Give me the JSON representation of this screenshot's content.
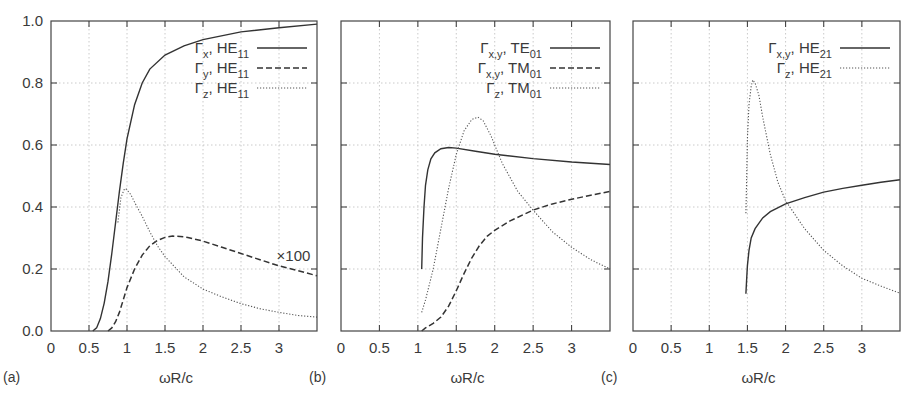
{
  "chart_data": [
    {
      "type": "line",
      "panel_label": "(a)",
      "xlabel": "ωR/c",
      "ylabel": "",
      "xlim": [
        0,
        3.5
      ],
      "ylim": [
        0,
        1.0
      ],
      "xticks": [
        "0",
        "0.5",
        "1",
        "1.5",
        "2",
        "2.5",
        "3"
      ],
      "yticks": [
        "0.0",
        "0.2",
        "0.4",
        "0.6",
        "0.8",
        "1.0"
      ],
      "grid": true,
      "legend_position": "upper right",
      "annotations": [
        {
          "text": "×100",
          "x": 3.1,
          "y": 0.24
        }
      ],
      "series": [
        {
          "name": "Γx, HE11",
          "symbol": "Γ",
          "sub1": "x",
          "mode": "HE",
          "sub2": "11",
          "style": "solid",
          "x": [
            0.55,
            0.6,
            0.65,
            0.7,
            0.75,
            0.8,
            0.85,
            0.9,
            0.95,
            1.0,
            1.1,
            1.2,
            1.3,
            1.5,
            1.75,
            2.0,
            2.5,
            3.0,
            3.5
          ],
          "y": [
            0.0,
            0.01,
            0.04,
            0.09,
            0.16,
            0.25,
            0.35,
            0.45,
            0.54,
            0.62,
            0.73,
            0.8,
            0.845,
            0.89,
            0.92,
            0.94,
            0.965,
            0.978,
            0.99
          ]
        },
        {
          "name": "Γy, HE11",
          "symbol": "Γ",
          "sub1": "y",
          "mode": "HE",
          "sub2": "11",
          "style": "dashed",
          "x": [
            0.75,
            0.8,
            0.85,
            0.9,
            0.95,
            1.0,
            1.1,
            1.2,
            1.3,
            1.4,
            1.5,
            1.6,
            1.7,
            1.8,
            2.0,
            2.25,
            2.5,
            2.75,
            3.0,
            3.25,
            3.5
          ],
          "y": [
            0.0,
            0.01,
            0.03,
            0.06,
            0.1,
            0.14,
            0.2,
            0.245,
            0.275,
            0.292,
            0.302,
            0.306,
            0.305,
            0.302,
            0.29,
            0.27,
            0.25,
            0.23,
            0.21,
            0.195,
            0.178
          ]
        },
        {
          "name": "Γz, HE11",
          "symbol": "Γ",
          "sub1": "z",
          "mode": "HE",
          "sub2": "11",
          "style": "dotted",
          "x": [
            0.88,
            0.92,
            0.96,
            0.98,
            1.0,
            1.05,
            1.1,
            1.2,
            1.3,
            1.4,
            1.5,
            1.75,
            2.0,
            2.25,
            2.5,
            2.75,
            3.0,
            3.25,
            3.5
          ],
          "y": [
            0.35,
            0.43,
            0.455,
            0.46,
            0.455,
            0.44,
            0.415,
            0.37,
            0.32,
            0.275,
            0.24,
            0.175,
            0.135,
            0.11,
            0.088,
            0.072,
            0.06,
            0.05,
            0.045
          ]
        }
      ]
    },
    {
      "type": "line",
      "panel_label": "(b)",
      "xlabel": "ωR/c",
      "ylabel": "",
      "xlim": [
        0,
        3.5
      ],
      "ylim": [
        0,
        1.0
      ],
      "xticks": [
        "0",
        "0.5",
        "1",
        "1.5",
        "2",
        "2.5",
        "3"
      ],
      "grid": true,
      "legend_position": "upper right",
      "series": [
        {
          "name": "Γx,y, TE01",
          "symbol": "Γ",
          "sub1": "x,y",
          "mode": "TE",
          "sub2": "01",
          "style": "solid",
          "x": [
            1.05,
            1.06,
            1.08,
            1.1,
            1.13,
            1.17,
            1.22,
            1.3,
            1.4,
            1.5,
            1.75,
            2.0,
            2.5,
            3.0,
            3.5
          ],
          "y": [
            0.2,
            0.3,
            0.4,
            0.47,
            0.52,
            0.555,
            0.575,
            0.588,
            0.592,
            0.59,
            0.58,
            0.57,
            0.556,
            0.545,
            0.537
          ]
        },
        {
          "name": "Γx,y, TM01",
          "symbol": "Γ",
          "sub1": "x,y",
          "mode": "TM",
          "sub2": "01",
          "style": "dashed",
          "x": [
            1.05,
            1.1,
            1.2,
            1.3,
            1.4,
            1.5,
            1.6,
            1.7,
            1.8,
            1.9,
            2.0,
            2.2,
            2.5,
            2.75,
            3.0,
            3.25,
            3.5
          ],
          "y": [
            0.0,
            0.01,
            0.025,
            0.045,
            0.08,
            0.13,
            0.185,
            0.235,
            0.275,
            0.305,
            0.325,
            0.355,
            0.39,
            0.41,
            0.425,
            0.438,
            0.45
          ]
        },
        {
          "name": "Γz, TM01",
          "symbol": "Γ",
          "sub1": "z",
          "mode": "TM",
          "sub2": "01",
          "style": "dotted",
          "x": [
            1.05,
            1.1,
            1.2,
            1.3,
            1.4,
            1.5,
            1.6,
            1.7,
            1.78,
            1.85,
            1.95,
            2.1,
            2.3,
            2.5,
            2.75,
            3.0,
            3.25,
            3.5
          ],
          "y": [
            0.06,
            0.1,
            0.2,
            0.33,
            0.46,
            0.57,
            0.645,
            0.682,
            0.69,
            0.678,
            0.63,
            0.54,
            0.45,
            0.39,
            0.32,
            0.27,
            0.23,
            0.2
          ]
        }
      ]
    },
    {
      "type": "line",
      "panel_label": "(c)",
      "xlabel": "ωR/c",
      "ylabel": "",
      "xlim": [
        0,
        3.5
      ],
      "ylim": [
        0,
        1.0
      ],
      "xticks": [
        "0",
        "0.5",
        "1",
        "1.5",
        "2",
        "2.5",
        "3"
      ],
      "grid": true,
      "legend_position": "upper right",
      "series": [
        {
          "name": "Γx,y, HE21",
          "symbol": "Γ",
          "sub1": "x,y",
          "mode": "HE",
          "sub2": "21",
          "style": "solid",
          "x": [
            1.48,
            1.49,
            1.5,
            1.52,
            1.55,
            1.6,
            1.7,
            1.8,
            2.0,
            2.25,
            2.5,
            2.75,
            3.0,
            3.25,
            3.5
          ],
          "y": [
            0.12,
            0.17,
            0.21,
            0.26,
            0.3,
            0.33,
            0.365,
            0.385,
            0.41,
            0.43,
            0.448,
            0.46,
            0.47,
            0.48,
            0.488
          ]
        },
        {
          "name": "Γz, HE21",
          "symbol": "Γ",
          "sub1": "z",
          "mode": "HE",
          "sub2": "21",
          "style": "dotted",
          "x": [
            1.48,
            1.49,
            1.5,
            1.52,
            1.55,
            1.57,
            1.6,
            1.65,
            1.7,
            1.8,
            1.9,
            2.0,
            2.25,
            2.5,
            2.75,
            3.0,
            3.25,
            3.5
          ],
          "y": [
            0.38,
            0.5,
            0.62,
            0.73,
            0.79,
            0.81,
            0.8,
            0.76,
            0.69,
            0.57,
            0.48,
            0.42,
            0.33,
            0.26,
            0.21,
            0.17,
            0.145,
            0.122
          ]
        }
      ]
    }
  ],
  "panels_layout": [
    {
      "left": 51,
      "right": 317,
      "top": 21,
      "bottom": 331
    },
    {
      "left": 341,
      "right": 610,
      "top": 21,
      "bottom": 331
    },
    {
      "left": 633,
      "right": 900,
      "top": 21,
      "bottom": 331
    }
  ]
}
